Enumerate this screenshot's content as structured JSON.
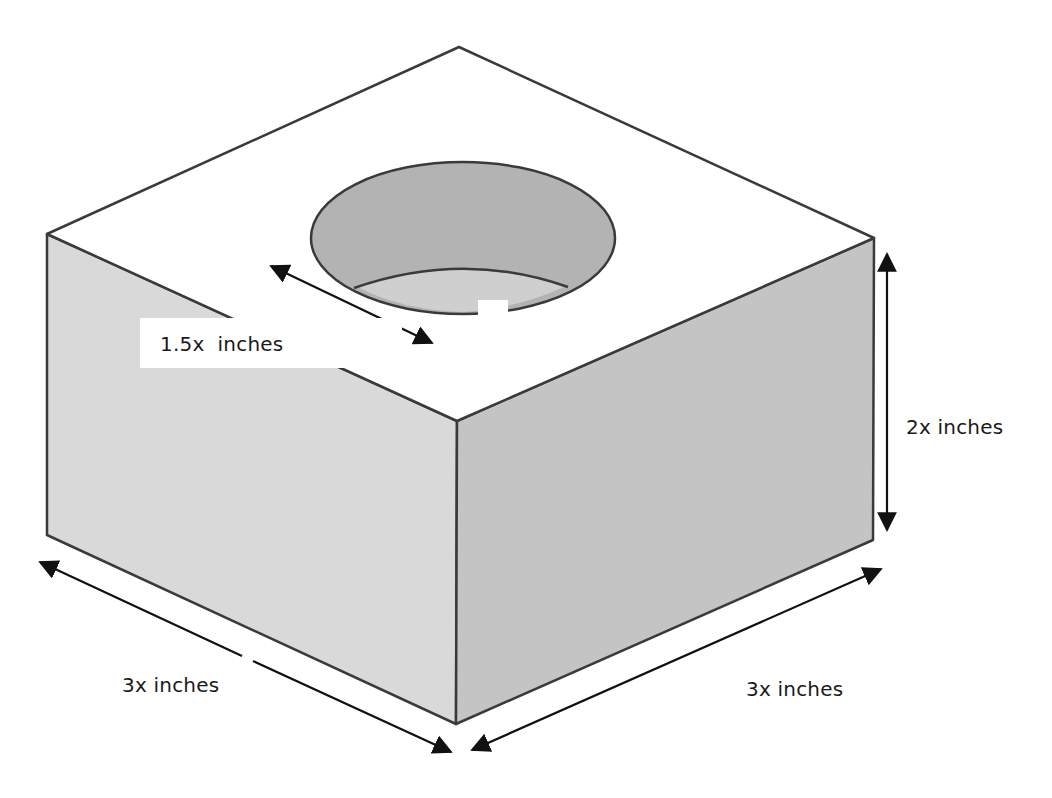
{
  "figure": {
    "colors": {
      "top_face": "#ffffff",
      "left_face": "#d9d9d9",
      "right_face": "#c4c4c4",
      "hole_wall": "#b3b3b3",
      "hole_floor": "#cfcfcf",
      "edge": "#3a3a3a",
      "arrow": "#111111"
    },
    "dimensions": {
      "hole_diameter": {
        "label": "1.5x  inches"
      },
      "height": {
        "label": "2x inches"
      },
      "left_length": {
        "label": "3x inches"
      },
      "right_width": {
        "label": "3x inches"
      }
    }
  },
  "caption": {
    "text": ""
  }
}
